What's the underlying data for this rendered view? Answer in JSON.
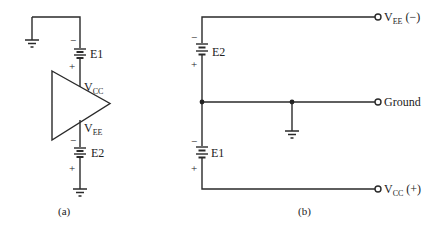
{
  "figure": {
    "panel_a": {
      "caption": "(a)",
      "battery_top": {
        "name": "E1",
        "minus": "−",
        "plus": "+"
      },
      "battery_bottom": {
        "name": "E2",
        "minus": "−",
        "plus": "+"
      },
      "amplifier": {
        "vcc_main": "V",
        "vcc_sub": "CC",
        "vee_main": "V",
        "vee_sub": "EE"
      }
    },
    "panel_b": {
      "caption": "(b)",
      "battery_top": {
        "name": "E2",
        "minus": "−",
        "plus": "+"
      },
      "battery_bottom": {
        "name": "E1",
        "minus": "−",
        "plus": "+"
      },
      "terminals": {
        "top": {
          "main": "V",
          "sub": "EE",
          "polarity": " (−)"
        },
        "middle": {
          "label": "Ground"
        },
        "bottom": {
          "main": "V",
          "sub": "CC",
          "polarity": " (+)"
        }
      }
    }
  }
}
